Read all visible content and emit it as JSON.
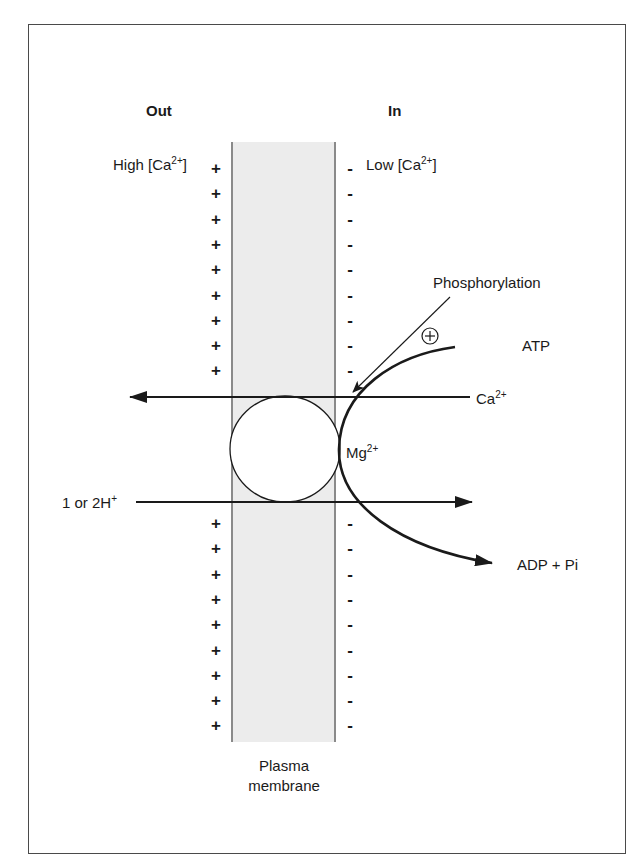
{
  "diagram": {
    "type": "membrane-transport",
    "headers": {
      "out": "Out",
      "in": "In"
    },
    "concentration": {
      "out_prefix": "High [Ca",
      "out_sup": "2+",
      "out_suffix": "]",
      "in_prefix": "Low [Ca",
      "in_sup": "2+",
      "in_suffix": "]"
    },
    "charges": {
      "out_symbol": "+",
      "in_symbol": "-",
      "top_count": 9,
      "bottom_count": 9
    },
    "labels": {
      "phosphorylation": "Phosphorylation",
      "stimulus_symbol": "+",
      "atp": "ATP",
      "calcium_base": "Ca",
      "calcium_sup": "2+",
      "magnesium_base": "Mg",
      "magnesium_sup": "2+",
      "proton_base": "1 or 2H",
      "proton_sup": "+",
      "products": "ADP + Pi",
      "membrane_line1": "Plasma",
      "membrane_line2": "membrane"
    },
    "flows": [
      {
        "ion": "Ca2+",
        "direction": "in-to-out"
      },
      {
        "ion": "1 or 2H+",
        "direction": "out-to-in"
      },
      {
        "reaction": "ATP -> ADP + Pi",
        "cofactor": "Mg2+"
      }
    ],
    "colors": {
      "membrane_fill": "#ececec",
      "membrane_edge": "#8a8a8a",
      "ink": "#1a1a1a",
      "frame": "#4a4a4a"
    }
  }
}
